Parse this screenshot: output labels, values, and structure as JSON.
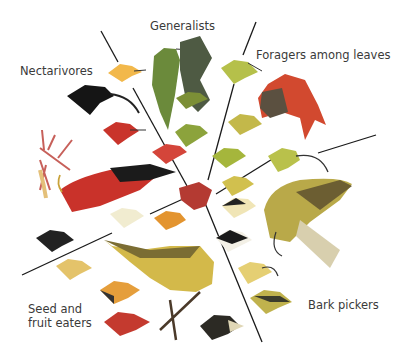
{
  "figure": {
    "groups": [
      {
        "id": "generalists",
        "label": "Generalists"
      },
      {
        "id": "foragers",
        "label": "Foragers among leaves"
      },
      {
        "id": "nectarivores",
        "label": "Nectarivores"
      },
      {
        "id": "seed",
        "label": "Seed and\nfruit eaters"
      },
      {
        "id": "bark",
        "label": "Bark pickers"
      }
    ],
    "colors": {
      "divider": "#1a1a1a",
      "hub": "#b43a32",
      "text": "#3a3a3a"
    }
  }
}
